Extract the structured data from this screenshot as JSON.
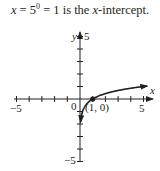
{
  "caption": {
    "var": "x",
    "eq1": " = 5",
    "exp": "0",
    "eq2": " = 1 is the ",
    "var2": "x",
    "tail": "-intercept."
  },
  "chart_data": {
    "type": "line",
    "xlabel": "x",
    "ylabel": "y",
    "xlim": [
      -5,
      5
    ],
    "ylim": [
      -5,
      5
    ],
    "x_tick_labels": [
      "-5",
      "5"
    ],
    "y_tick_labels": [
      "5",
      "-5"
    ],
    "origin_label": "0",
    "grid": false,
    "series": [
      {
        "name": "y = log_5 x",
        "x": [
          0.04,
          0.1,
          0.2,
          0.5,
          1,
          2,
          3,
          4,
          5,
          5.3
        ],
        "y": [
          -2,
          -1.43,
          -1,
          -0.43,
          0,
          0.43,
          0.68,
          0.86,
          1,
          1.04
        ]
      }
    ],
    "annotations": [
      {
        "point": [
          1,
          0
        ],
        "label": "(1, 0)"
      }
    ]
  },
  "labels": {
    "y_axis": "y",
    "x_axis": "x",
    "y_top": "5",
    "y_bottom": "−5",
    "x_left": "−5",
    "x_right": "5",
    "origin": "0",
    "point": "(1, 0)"
  }
}
